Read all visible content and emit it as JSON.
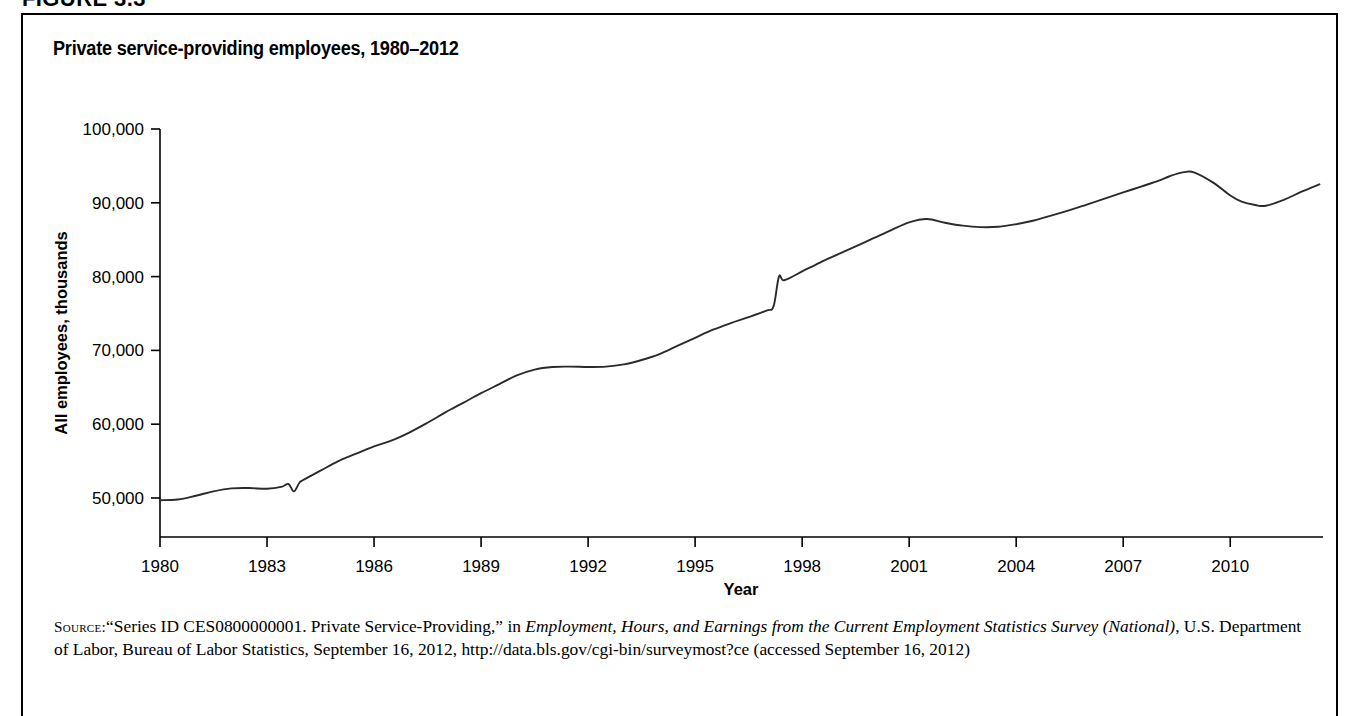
{
  "figure": {
    "header": "FIGURE 3.3",
    "title": "Private service-providing employees, 1980–2012"
  },
  "source": {
    "label": "Source:",
    "text_part1": "“Series ID CES0800000001. Private Service-Providing,” in ",
    "italic1": "Employment, Hours, and Earnings from the Current Employment Statistics Survey (National)",
    "text_part2": ", U.S. Department of Labor, Bureau of Labor Statistics, September 16, 2012, http://data.bls.gov/cgi-bin/surveymost?ce (accessed September 16, 2012)"
  },
  "chart_data": {
    "type": "line",
    "title": "Private service-providing employees, 1980–2012",
    "xlabel": "Year",
    "ylabel": "All employees, thousands",
    "xlim": [
      1980,
      2012.6
    ],
    "ylim": [
      45000,
      100000
    ],
    "grid": false,
    "legend": "none",
    "line_color": "#2b2b2b",
    "xticks": [
      1980,
      1983,
      1986,
      1989,
      1992,
      1995,
      1998,
      2001,
      2004,
      2007,
      2010
    ],
    "xtick_labels": [
      "1980",
      "1983",
      "1986",
      "1989",
      "1992",
      "1995",
      "1998",
      "2001",
      "2004",
      "2007",
      "2010"
    ],
    "yticks": [
      50000,
      60000,
      70000,
      80000,
      90000,
      100000
    ],
    "ytick_labels": [
      "50,000",
      "60,000",
      "70,000",
      "80,000",
      "90,000",
      "100,000"
    ],
    "series": [
      {
        "name": "Private service-providing employees",
        "x": [
          1980.0,
          1980.5,
          1981.0,
          1981.5,
          1982.0,
          1982.5,
          1983.0,
          1983.4,
          1983.6,
          1983.75,
          1983.9,
          1984.0,
          1984.5,
          1985.0,
          1985.5,
          1986.0,
          1986.5,
          1987.0,
          1987.5,
          1988.0,
          1988.5,
          1989.0,
          1989.5,
          1990.0,
          1990.5,
          1991.0,
          1991.5,
          1992.0,
          1992.5,
          1993.0,
          1993.5,
          1994.0,
          1994.5,
          1995.0,
          1995.5,
          1996.0,
          1996.5,
          1997.0,
          1997.2,
          1997.35,
          1997.5,
          1998.0,
          1998.5,
          1999.0,
          1999.5,
          2000.0,
          2000.5,
          2001.0,
          2001.5,
          2002.0,
          2002.5,
          2003.0,
          2003.5,
          2004.0,
          2004.5,
          2005.0,
          2005.5,
          2006.0,
          2006.5,
          2007.0,
          2007.5,
          2008.0,
          2008.3,
          2008.7,
          2009.0,
          2009.5,
          2010.0,
          2010.3,
          2010.7,
          2011.0,
          2011.5,
          2012.0,
          2012.5
        ],
        "y": [
          49700,
          49800,
          50300,
          50900,
          51300,
          51350,
          51250,
          51500,
          51900,
          50900,
          52000,
          52400,
          53700,
          55000,
          56000,
          57000,
          57800,
          58900,
          60200,
          61600,
          62900,
          64200,
          65400,
          66600,
          67400,
          67750,
          67800,
          67750,
          67800,
          68100,
          68700,
          69500,
          70600,
          71700,
          72800,
          73700,
          74500,
          75400,
          76000,
          80000,
          79500,
          80700,
          81900,
          83000,
          84100,
          85200,
          86300,
          87350,
          87800,
          87300,
          86900,
          86700,
          86750,
          87100,
          87600,
          88300,
          89000,
          89800,
          90600,
          91400,
          92200,
          93000,
          93600,
          94150,
          94100,
          92800,
          91000,
          90200,
          89700,
          89600,
          90400,
          91500,
          92500
        ],
        "annotations": [
          {
            "x": 1983.75,
            "note": "downward spike artifact near 1983-84"
          },
          {
            "x": 1997.3,
            "note": "upward step artifact near 1997"
          }
        ],
        "key_points": [
          {
            "year": 1980,
            "value": 49700
          },
          {
            "year": 1982.5,
            "value": 51350
          },
          {
            "year": 1991.5,
            "value": 67800
          },
          {
            "year": 2001,
            "value": 87800
          },
          {
            "year": 2003,
            "value": 86700
          },
          {
            "year": 2008.3,
            "value": 94200
          },
          {
            "year": 2010.3,
            "value": 89600
          },
          {
            "year": 2012.5,
            "value": 93800
          }
        ]
      }
    ]
  }
}
